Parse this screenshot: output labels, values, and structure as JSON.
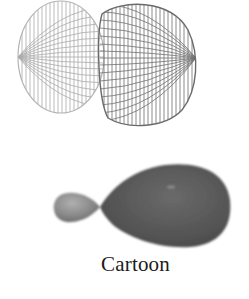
{
  "figure": {
    "wireframe_model": {
      "label": "",
      "left_lobe_color": "#a8a8a8",
      "right_lobe_color": "#6e6e6e"
    },
    "cartoon_model": {
      "small_lobe_color": "#8c8c8c",
      "large_lobe_color": "#5a5a5a"
    },
    "caption": "Cartoon"
  }
}
